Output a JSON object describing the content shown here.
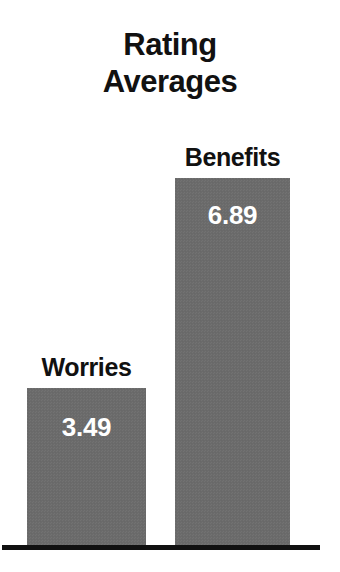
{
  "chart_data": {
    "type": "bar",
    "title": "Rating\nAverages",
    "title_line1": "Rating",
    "title_line2": "Averages",
    "categories": [
      "Worries",
      "Benefits"
    ],
    "values": [
      3.49,
      6.89
    ],
    "value_labels": [
      "3.49",
      "6.89"
    ],
    "series": [
      {
        "name": "Rating Average",
        "values": [
          3.49,
          6.89
        ]
      }
    ],
    "xlabel": "",
    "ylabel": "",
    "ylim": [
      0,
      7.6
    ],
    "grid": false,
    "legend": false,
    "legend_position": "none",
    "orientation": "vertical",
    "bar_color": "#6b6b6b",
    "value_label_color": "#ffffff",
    "category_label_color": "#111111",
    "axis_color": "#111111",
    "background_color": "#ffffff",
    "annotations": []
  },
  "bars": [
    {
      "category": "Worries",
      "value_label": "3.49"
    },
    {
      "category": "Benefits",
      "value_label": "6.89"
    }
  ]
}
